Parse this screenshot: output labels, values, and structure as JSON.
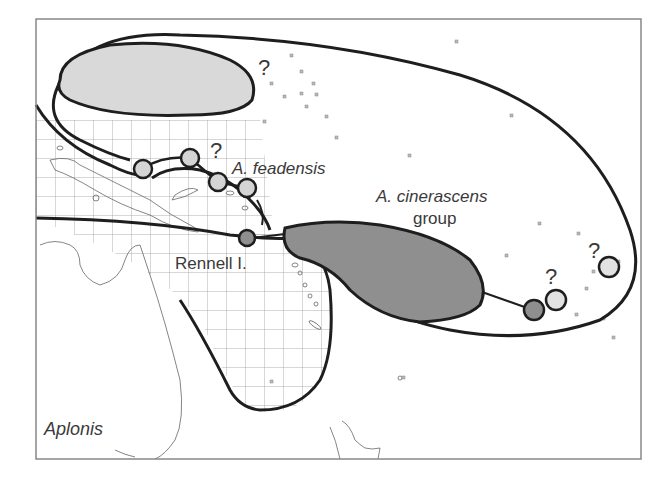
{
  "figure": {
    "type": "biogeographic distribution map",
    "genus_label": "Aplonis",
    "colors": {
      "frame": "#888888",
      "outline": "#1e1e1e",
      "light_fill": "#d9d9d9",
      "dark_fill": "#8f8f8f",
      "grid": "#9a9a9a",
      "coast": "#666666",
      "text": "#3a3a3a"
    }
  },
  "labels": {
    "feadensis": "A. feadensis",
    "cinerascens_line1": "A. cinerascens",
    "cinerascens_line2": "group",
    "rennell": "Rennell I.",
    "genus": "Aplonis",
    "q1": "?",
    "q2": "?",
    "q3": "?",
    "q4": "?"
  },
  "legend": {
    "light_gray_circles": "A. feadensis populations (uncertain)",
    "dark_gray_circles": "A. cinerascens group populations",
    "hatched_region": "New Guinea / Australia area"
  }
}
